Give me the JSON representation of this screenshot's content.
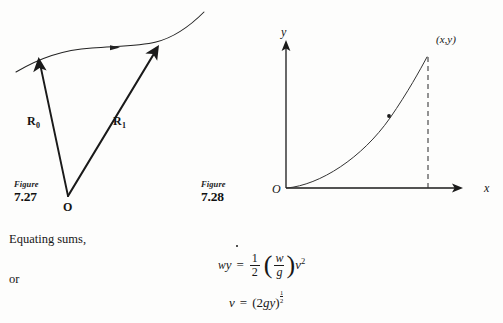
{
  "page": {
    "background_color": "#fdfdfc",
    "ink_color": "#1a1a1a"
  },
  "figures": [
    {
      "id": "figure-7-27",
      "caption_word": "Figure",
      "caption_number": "7.27",
      "origin_label": "O",
      "vectors": [
        {
          "name": "R-zero",
          "base": "R",
          "subscript": "0"
        },
        {
          "name": "R-one",
          "base": "R",
          "subscript": "1"
        }
      ],
      "description": "Two position vectors drawn from origin O to points on a directed path curve"
    },
    {
      "id": "figure-7-28",
      "caption_word": "Figure",
      "caption_number": "7.28",
      "origin_label": "O",
      "y_axis_label": "y",
      "x_axis_label": "x",
      "point_label": "(x,y)",
      "description": "Parabolic trajectory curve rising from origin to labelled point with dashed drop line"
    }
  ],
  "prose": {
    "line_1": "Equating sums,",
    "line_2": "or"
  },
  "equations": [
    {
      "id": "energy-equation",
      "lhs_w": "w",
      "lhs_y": "y",
      "relation": "=",
      "frac_numerator": "1",
      "frac_denominator": "2",
      "paren_open": "(",
      "inner_numerator": "w",
      "inner_denominator": "g",
      "paren_close": ")",
      "rhs_var": "v",
      "rhs_exponent": "2",
      "plain": "wy = 1/2 (w/g) v^2"
    },
    {
      "id": "velocity-equation",
      "lhs": "v",
      "relation": "=",
      "rhs_open": "(",
      "rhs_body_2": "2",
      "rhs_body_g": "g",
      "rhs_body_y": "y",
      "rhs_close": ")",
      "exponent_numerator": "1",
      "exponent_denominator": "2",
      "plain": "v = (2gy)^(1/2)"
    }
  ]
}
